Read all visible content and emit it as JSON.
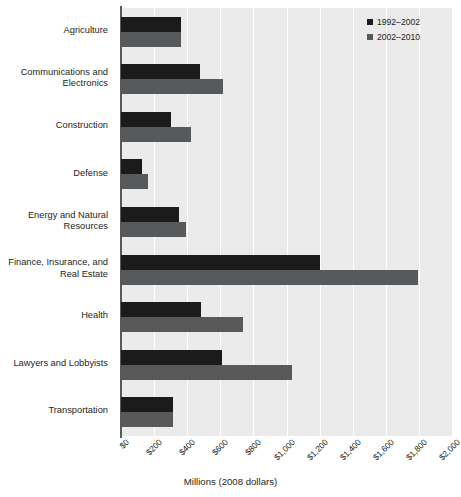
{
  "chart_data": {
    "type": "bar",
    "orientation": "horizontal",
    "title": "",
    "xlabel": "Millions (2008 dollars)",
    "ylabel": "",
    "xlim": [
      0,
      2000
    ],
    "xticks": [
      0,
      200,
      400,
      600,
      800,
      1000,
      1200,
      1400,
      1600,
      1800,
      2000
    ],
    "xtick_labels": [
      "$0",
      "$200",
      "$400",
      "$600",
      "$800",
      "$1,000",
      "$1,200",
      "$1,400",
      "$1,600",
      "$1,800",
      "$2,000"
    ],
    "grid": true,
    "grid_axis": "x",
    "legend_position": "top-right",
    "categories": [
      "Agriculture",
      "Communications and\nElectronics",
      "Construction",
      "Defense",
      "Energy and Natural\nResources",
      "Finance, Insurance, and\nReal Estate",
      "Health",
      "Lawyers and Lobbyists",
      "Transportation"
    ],
    "series": [
      {
        "name": "1992–2002",
        "color": "#1b1b1b",
        "values": [
          360,
          478,
          302,
          128,
          350,
          1205,
          483,
          610,
          315
        ]
      },
      {
        "name": "2002–2010",
        "color": "#58595b",
        "values": [
          360,
          617,
          423,
          163,
          393,
          1795,
          737,
          1035,
          315
        ]
      }
    ]
  },
  "legend": {
    "items": [
      {
        "label": "1992–2002",
        "color": "#1b1b1b",
        "swatch": "square-marker-icon"
      },
      {
        "label": "2002–2010",
        "color": "#58595b",
        "swatch": "square-marker-icon"
      }
    ]
  },
  "axis": {
    "x_title": "Millions (2008 dollars)"
  }
}
